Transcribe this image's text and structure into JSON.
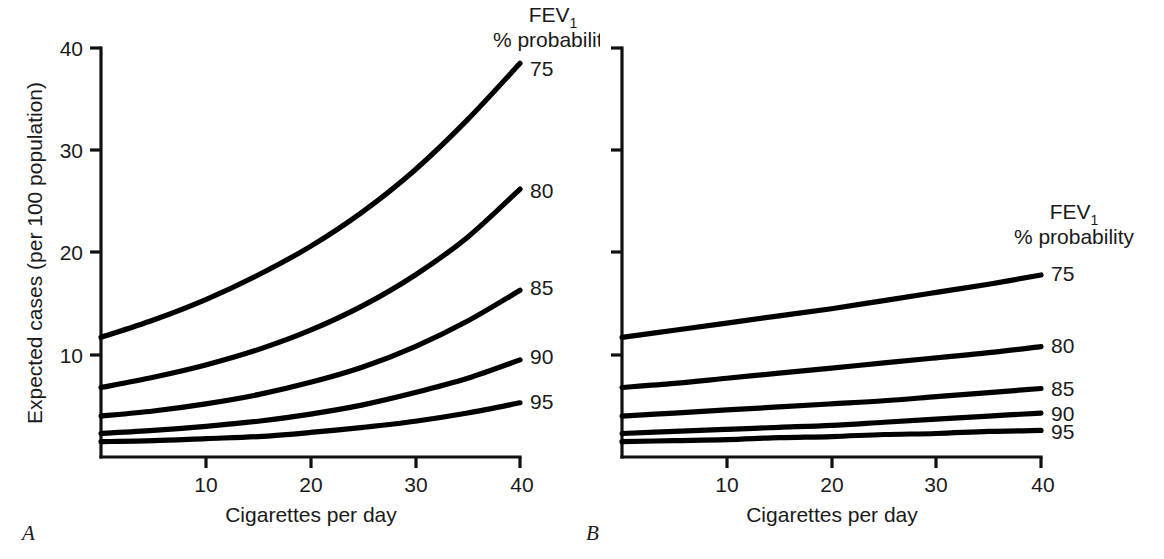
{
  "figure": {
    "panels": [
      {
        "id": "A",
        "letter": "A",
        "legend": {
          "line1": "FEV",
          "line1_sub": "1",
          "line2": "% probability"
        },
        "xaxis": {
          "label": "Cigarettes per day",
          "ticks": [
            "10",
            "20",
            "30",
            "40"
          ],
          "tick_values": [
            10,
            20,
            30,
            40
          ],
          "range": [
            0,
            40
          ]
        },
        "yaxis": {
          "label": "Expected cases (per 100 population)",
          "ticks": [
            "10",
            "20",
            "30",
            "40"
          ],
          "tick_values": [
            10,
            20,
            30,
            40
          ],
          "range": [
            0,
            40
          ]
        },
        "series_labels": [
          "75",
          "80",
          "85",
          "90",
          "95"
        ]
      },
      {
        "id": "B",
        "letter": "B",
        "legend": {
          "line1": "FEV",
          "line1_sub": "1",
          "line2": "% probability"
        },
        "xaxis": {
          "label": "Cigarettes per day",
          "ticks": [
            "10",
            "20",
            "30",
            "40"
          ],
          "tick_values": [
            10,
            20,
            30,
            40
          ],
          "range": [
            0,
            40
          ]
        },
        "yaxis": {
          "label": "",
          "ticks": [
            "",
            "",
            "",
            ""
          ],
          "tick_values": [
            10,
            20,
            30,
            40
          ],
          "range": [
            0,
            40
          ]
        },
        "series_labels": [
          "75",
          "80",
          "85",
          "90",
          "95"
        ]
      }
    ]
  },
  "chart_data": [
    {
      "type": "line",
      "panel": "A",
      "title": "",
      "xlabel": "Cigarettes per day",
      "ylabel": "Expected cases (per 100 population)",
      "xlim": [
        0,
        40
      ],
      "ylim": [
        0,
        40
      ],
      "xticks": [
        10,
        20,
        30,
        40
      ],
      "yticks": [
        10,
        20,
        30,
        40
      ],
      "grid": false,
      "legend": "FEV1 % probability (right of curve ends)",
      "x": [
        0,
        5,
        10,
        15,
        20,
        25,
        30,
        35,
        40
      ],
      "series": [
        {
          "name": "75",
          "values": [
            11.7,
            13.4,
            15.4,
            17.8,
            20.6,
            24.0,
            28.1,
            33.0,
            38.5
          ]
        },
        {
          "name": "80",
          "values": [
            6.8,
            7.8,
            9.0,
            10.5,
            12.4,
            14.8,
            17.8,
            21.5,
            26.2
          ]
        },
        {
          "name": "85",
          "values": [
            4.0,
            4.5,
            5.2,
            6.1,
            7.3,
            8.8,
            10.8,
            13.3,
            16.3
          ]
        },
        {
          "name": "90",
          "values": [
            2.3,
            2.6,
            3.0,
            3.5,
            4.2,
            5.1,
            6.3,
            7.7,
            9.5
          ]
        },
        {
          "name": "95",
          "values": [
            1.5,
            1.6,
            1.8,
            2.0,
            2.4,
            2.9,
            3.5,
            4.3,
            5.3
          ]
        }
      ]
    },
    {
      "type": "line",
      "panel": "B",
      "title": "",
      "xlabel": "Cigarettes per day",
      "ylabel": "",
      "xlim": [
        0,
        40
      ],
      "ylim": [
        0,
        40
      ],
      "xticks": [
        10,
        20,
        30,
        40
      ],
      "yticks": [
        10,
        20,
        30,
        40
      ],
      "grid": false,
      "legend": "FEV1 % probability (right of curve ends)",
      "x": [
        0,
        5,
        10,
        15,
        20,
        25,
        30,
        35,
        40
      ],
      "series": [
        {
          "name": "75",
          "values": [
            11.7,
            12.4,
            13.1,
            13.8,
            14.5,
            15.3,
            16.1,
            16.9,
            17.8
          ]
        },
        {
          "name": "80",
          "values": [
            6.8,
            7.2,
            7.7,
            8.2,
            8.7,
            9.2,
            9.7,
            10.2,
            10.8
          ]
        },
        {
          "name": "85",
          "values": [
            4.0,
            4.3,
            4.6,
            4.9,
            5.2,
            5.5,
            5.9,
            6.3,
            6.7
          ]
        },
        {
          "name": "90",
          "values": [
            2.3,
            2.5,
            2.7,
            2.9,
            3.1,
            3.4,
            3.7,
            4.0,
            4.3
          ]
        },
        {
          "name": "95",
          "values": [
            1.5,
            1.6,
            1.7,
            1.9,
            2.0,
            2.2,
            2.3,
            2.5,
            2.6
          ]
        }
      ]
    }
  ]
}
